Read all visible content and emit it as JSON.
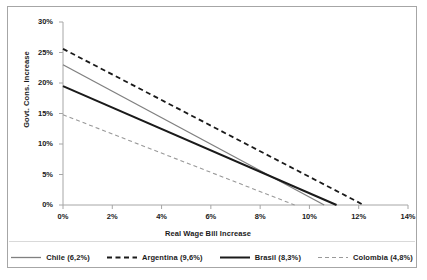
{
  "chart_data": {
    "type": "line",
    "title": "",
    "xlabel": "Real Wage Bill Increase",
    "ylabel": "Govt. Cons. Increase",
    "xlim": [
      0,
      14
    ],
    "ylim": [
      0,
      30
    ],
    "xticks": [
      "0%",
      "2%",
      "4%",
      "6%",
      "8%",
      "10%",
      "12%",
      "14%"
    ],
    "xtick_values": [
      0,
      2,
      4,
      6,
      8,
      10,
      12,
      14
    ],
    "yticks": [
      "0%",
      "5%",
      "10%",
      "15%",
      "20%",
      "25%",
      "30%"
    ],
    "ytick_values": [
      0,
      5,
      10,
      15,
      20,
      25,
      30
    ],
    "grid": false,
    "legend_position": "bottom",
    "series": [
      {
        "name": "Chile (6,2%)",
        "label": "Chile (6,2%)",
        "style": "solid",
        "color": "#808080",
        "width": 1.3,
        "x": [
          0,
          10.6
        ],
        "y": [
          23.0,
          0
        ]
      },
      {
        "name": "Argentina (9,6%)",
        "label": "Argentina (9,6%)",
        "style": "dashed",
        "color": "#1a1a1a",
        "width": 1.8,
        "x": [
          0,
          12.2
        ],
        "y": [
          25.6,
          0
        ]
      },
      {
        "name": "Brasil (8,3%)",
        "label": "Brasil (8,3%)",
        "style": "solid",
        "color": "#1a1a1a",
        "width": 2.0,
        "x": [
          0,
          11.1
        ],
        "y": [
          19.5,
          0
        ]
      },
      {
        "name": "Colombia (4,8%)",
        "label": "Colombia (4,8%)",
        "style": "dashed",
        "color": "#999999",
        "width": 1.1,
        "x": [
          0,
          9.4
        ],
        "y": [
          14.8,
          0
        ]
      }
    ]
  },
  "axes": {
    "y_title": "Govt. Cons. Increase",
    "x_title": "Real Wage Bill Increase",
    "y_labels": [
      "30%",
      "25%",
      "20%",
      "15%",
      "10%",
      "5%",
      "0%"
    ],
    "x_labels": [
      "0%",
      "2%",
      "4%",
      "6%",
      "8%",
      "10%",
      "12%",
      "14%"
    ]
  },
  "legend": {
    "items": [
      {
        "label": "Chile (6,2%)"
      },
      {
        "label": "Argentina (9,6%)"
      },
      {
        "label": "Brasil (8,3%)"
      },
      {
        "label": "Colombia (4,8%)"
      }
    ]
  },
  "colors": {
    "axis": "#a6a6a6",
    "text": "#1a1a1a",
    "chile": "#808080",
    "argentina": "#1a1a1a",
    "brasil": "#1a1a1a",
    "colombia": "#999999",
    "frame": "#a6a6a6"
  }
}
